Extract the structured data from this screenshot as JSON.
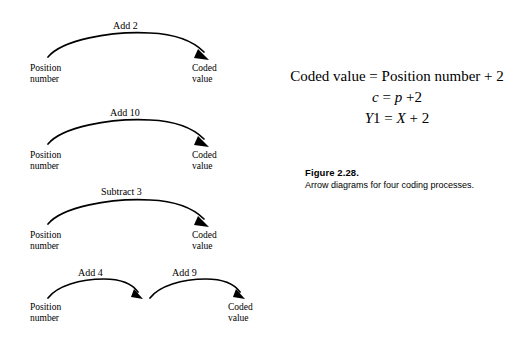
{
  "figure": {
    "caption_title": "Figure 2.28.",
    "caption_text": "Arrow diagrams for four coding processes."
  },
  "equations": {
    "line_words": "Coded value  =  Position number + 2",
    "line_c_left": "c",
    "line_c_eq": "=",
    "line_c_right": "p",
    "line_c_tail": "+2",
    "line_y_left": "Y",
    "line_y_left_sub": "1",
    "line_y_eq": "=",
    "line_y_right": "X",
    "line_y_tail": "+ 2"
  },
  "diagrams": [
    {
      "id": "diagram-1",
      "operation": "Add 2",
      "source_line1": "Position",
      "source_line2": "number",
      "target_line1": "Coded",
      "target_line2": "value"
    },
    {
      "id": "diagram-2",
      "operation": "Add 10",
      "source_line1": "Position",
      "source_line2": "number",
      "target_line1": "Coded",
      "target_line2": "value"
    },
    {
      "id": "diagram-3",
      "operation": "Subtract 3",
      "source_line1": "Position",
      "source_line2": "number",
      "target_line1": "Coded",
      "target_line2": "value"
    },
    {
      "id": "diagram-4",
      "operation_first": "Add 4",
      "operation_second": "Add 9",
      "source_line1": "Position",
      "source_line2": "number",
      "target_line1": "Coded",
      "target_line2": "value"
    }
  ],
  "colors": {
    "ink": "#000000",
    "background": "#ffffff"
  }
}
